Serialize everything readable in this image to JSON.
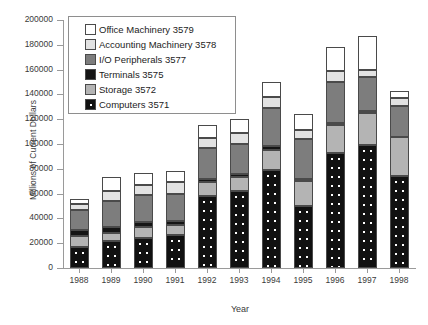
{
  "chart_data": {
    "type": "bar",
    "subtype": "stacked-bar",
    "title": "",
    "xlabel": "Year",
    "ylabel": "Millions of Current Dollars",
    "categories": [
      "1988",
      "1989",
      "1990",
      "1991",
      "1992",
      "1993",
      "1994",
      "1995",
      "1996",
      "1997",
      "1998"
    ],
    "ylim": [
      0,
      200000
    ],
    "ytick_values": [
      0,
      20000,
      40000,
      60000,
      80000,
      100000,
      120000,
      140000,
      160000,
      180000,
      200000
    ],
    "ytick_labels": [
      "0",
      "20000",
      "40000",
      "60000",
      "80000",
      "100000",
      "120000",
      "140000",
      "160000",
      "180000",
      "200000"
    ],
    "grid": false,
    "legend_position": "upper-left-inside",
    "stack_order_bottom_to_top": [
      "Computers 3571",
      "Storage 3572",
      "Terminals 3575",
      "I/O Peripherals 3577",
      "Accounting Machinery 3578",
      "Office Machinery 3579"
    ],
    "series": [
      {
        "name": "Computers 3571",
        "color": "#111111",
        "pattern": "dotted",
        "values": [
          17000,
          22000,
          24000,
          27000,
          58000,
          62000,
          79000,
          50000,
          93000,
          99000,
          74000
        ]
      },
      {
        "name": "Storage 3572",
        "color": "#b4b4b4",
        "pattern": "solid",
        "values": [
          9000,
          6000,
          9000,
          8000,
          11000,
          11000,
          16000,
          20000,
          22000,
          26000,
          32000
        ]
      },
      {
        "name": "Terminals 3575",
        "color": "#151515",
        "pattern": "solid",
        "values": [
          5000,
          5000,
          4000,
          3000,
          3000,
          3000,
          3000,
          2000,
          2000,
          2000,
          0
        ]
      },
      {
        "name": "I/O Peripherals 3577",
        "color": "#7d7d7d",
        "pattern": "solid",
        "values": [
          16000,
          21000,
          22000,
          22000,
          25000,
          24000,
          31000,
          32000,
          33000,
          27000,
          25000
        ]
      },
      {
        "name": "Accounting Machinery 3578",
        "color": "#e2e2e2",
        "pattern": "solid",
        "values": [
          5000,
          8000,
          8000,
          9000,
          8000,
          9000,
          9000,
          7000,
          9000,
          6000,
          6000
        ]
      },
      {
        "name": "Office Machinery 3579",
        "color": "#ffffff",
        "pattern": "solid",
        "values": [
          4000,
          11000,
          10000,
          9000,
          10000,
          11000,
          12000,
          13000,
          19000,
          27000,
          6000
        ]
      }
    ],
    "totals": [
      56000,
      73000,
      77000,
      78000,
      115000,
      120000,
      150000,
      124000,
      178000,
      187000,
      143000
    ]
  },
  "legend": {
    "items": [
      {
        "label": "Office Machinery 3579",
        "swatch": "seg-office"
      },
      {
        "label": "Accounting Machinery 3578",
        "swatch": "seg-accounting"
      },
      {
        "label": "I/O Peripherals 3577",
        "swatch": "seg-io"
      },
      {
        "label": "Terminals 3575",
        "swatch": "seg-terminals"
      },
      {
        "label": "Storage 3572",
        "swatch": "seg-storage"
      },
      {
        "label": "Computers 3571",
        "swatch": "seg-computers"
      }
    ]
  }
}
